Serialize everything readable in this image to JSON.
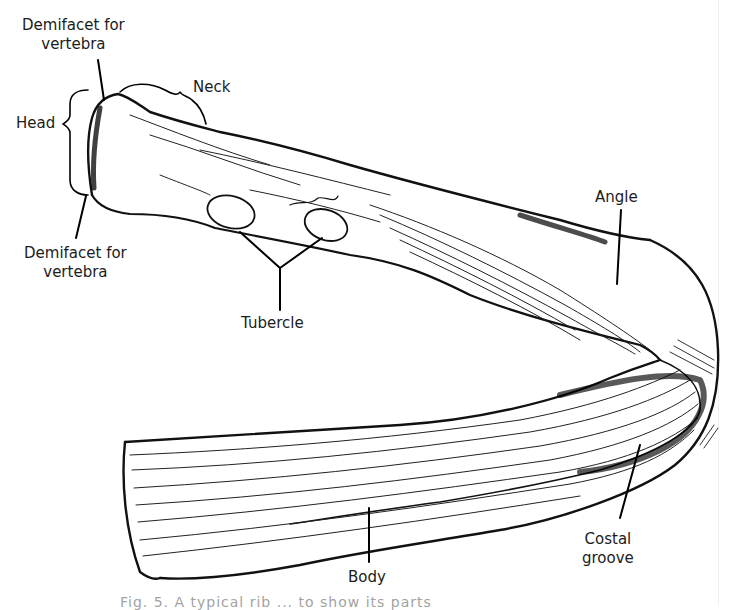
{
  "figure": {
    "labels": {
      "demifacet_top": [
        "Demifacet for",
        "vertebra"
      ],
      "neck": "Neck",
      "head": "Head",
      "demifacet_bottom": [
        "Demifacet for",
        "vertebra"
      ],
      "tubercle": "Tubercle",
      "angle": "Angle",
      "body": "Body",
      "costal_groove": [
        "Costal",
        "groove"
      ]
    },
    "caption_fragment": "Fig. 5. A typical rib ... to show its parts"
  }
}
